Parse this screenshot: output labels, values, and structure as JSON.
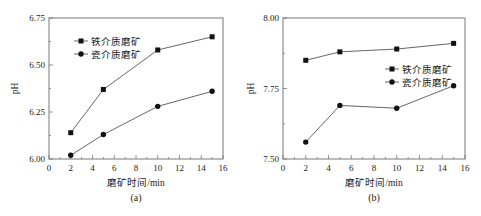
{
  "chart_data": [
    {
      "id": "a",
      "type": "line",
      "title": "",
      "caption": "(a)",
      "xlabel": "磨矿时间/min",
      "ylabel": "pH",
      "xlim": [
        0,
        16
      ],
      "ylim": [
        6.0,
        6.75
      ],
      "xticks": [
        0,
        2,
        4,
        6,
        8,
        10,
        12,
        14,
        16
      ],
      "yticks": [
        "6.00",
        "6.25",
        "6.50",
        "6.75"
      ],
      "grid": false,
      "legend_position": "upper left",
      "x": [
        2,
        5,
        10,
        15
      ],
      "series": [
        {
          "name": "铁介质磨矿",
          "marker": "square",
          "values": [
            6.14,
            6.37,
            6.58,
            6.65
          ]
        },
        {
          "name": "瓷介质磨矿",
          "marker": "circle",
          "values": [
            6.02,
            6.13,
            6.28,
            6.36
          ]
        }
      ]
    },
    {
      "id": "b",
      "type": "line",
      "title": "",
      "caption": "(b)",
      "xlabel": "磨矿时间/min",
      "ylabel": "pH",
      "xlim": [
        0,
        16
      ],
      "ylim": [
        7.5,
        8.0
      ],
      "xticks": [
        0,
        2,
        4,
        6,
        8,
        10,
        12,
        14,
        16
      ],
      "yticks": [
        "7.50",
        "7.75",
        "8.00"
      ],
      "grid": false,
      "legend_position": "center right",
      "x": [
        2,
        5,
        10,
        15
      ],
      "series": [
        {
          "name": "铁介质磨矿",
          "marker": "square",
          "values": [
            7.85,
            7.88,
            7.89,
            7.91
          ]
        },
        {
          "name": "瓷介质磨矿",
          "marker": "circle",
          "values": [
            7.56,
            7.69,
            7.68,
            7.76
          ]
        }
      ]
    }
  ],
  "colors": {
    "line": "#555555",
    "marker": "#111111",
    "axis": "#777777"
  }
}
